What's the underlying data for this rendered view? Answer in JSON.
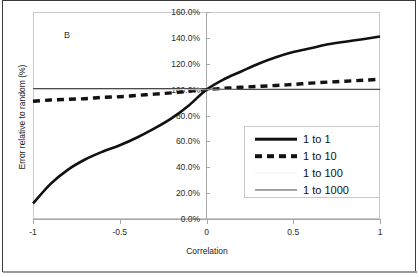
{
  "figure": {
    "panel_label": "B"
  },
  "chart_data": {
    "type": "line",
    "title": "",
    "xlabel": "Correlation",
    "ylabel": "Error relative to random (%)",
    "xlim": [
      -1,
      1
    ],
    "ylim": [
      0,
      160
    ],
    "grid": false,
    "legend_position": "center-right",
    "xticks": [
      -1,
      -0.5,
      0,
      0.5,
      1
    ],
    "xtick_labels": [
      "-1",
      "-0.5",
      "0",
      "0.5",
      "1"
    ],
    "yticks": [
      0,
      20,
      40,
      60,
      80,
      100,
      120,
      140,
      160
    ],
    "ytick_labels": [
      "0.0%",
      "20.0%",
      "40.0%",
      "60.0%",
      "80.0%",
      "100.0%",
      "120.0%",
      "140.0%",
      "160.0%"
    ],
    "x": [
      -1,
      -0.9,
      -0.8,
      -0.7,
      -0.6,
      -0.5,
      -0.4,
      -0.3,
      -0.2,
      -0.1,
      0,
      0.1,
      0.2,
      0.3,
      0.4,
      0.5,
      0.6,
      0.7,
      0.8,
      0.9,
      1
    ],
    "series": [
      {
        "name": "1 to 1",
        "style": "solid",
        "width": "thick",
        "color": "#111111",
        "values": [
          12,
          27,
          38,
          46,
          52,
          57,
          63,
          70,
          78,
          88,
          100,
          108,
          114,
          120,
          125,
          129,
          132,
          135,
          137,
          139,
          141
        ]
      },
      {
        "name": "1 to 10",
        "style": "dashed",
        "width": "thick",
        "color": "#111111",
        "values": [
          91,
          92,
          92.5,
          93,
          94,
          94.5,
          95.5,
          96.5,
          97.5,
          98.8,
          100,
          101,
          101.8,
          102.5,
          103.2,
          104,
          105,
          105.8,
          106.5,
          107.2,
          108
        ]
      },
      {
        "name": "1 to 100",
        "style": "solid",
        "width": "faint",
        "color": "#efefef",
        "values": [
          100,
          100,
          100,
          100,
          100,
          100,
          100,
          100,
          100,
          100,
          100,
          100,
          100,
          100,
          100,
          100,
          100,
          100,
          100,
          100,
          100
        ]
      },
      {
        "name": "1 to 1000",
        "style": "solid",
        "width": "thin",
        "color": "#4a4a4a",
        "values": [
          100.8,
          100.8,
          100.8,
          100.8,
          100.8,
          100.8,
          100.8,
          100.8,
          100.8,
          100.8,
          100.5,
          100.3,
          100.2,
          100.2,
          100.2,
          100.2,
          100.2,
          100.2,
          100.2,
          100.2,
          100.2
        ]
      }
    ]
  }
}
